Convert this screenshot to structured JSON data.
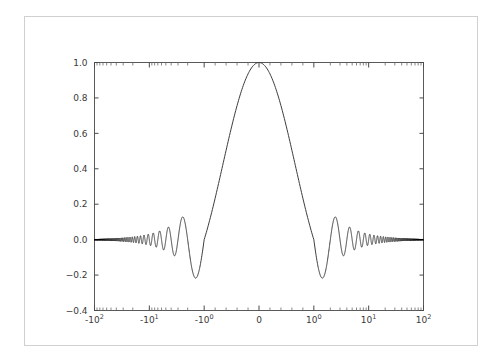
{
  "figure": {
    "background_color": "#ffffff",
    "border_color": "#d0d0d0",
    "line_color": "#3c3c3c",
    "axis_color": "#5a5a5a"
  },
  "chart_data": {
    "type": "line",
    "title": "",
    "xlabel": "",
    "ylabel": "",
    "function": "sinc",
    "xscale": "symlog",
    "yscale": "linear",
    "linthresh": 1,
    "xlim": [
      -100,
      100
    ],
    "ylim": [
      -0.4,
      1.0
    ],
    "grid": false,
    "legend": null,
    "x_tick_labels": [
      "-10^2",
      "-10^1",
      "-10^0",
      "0",
      "10^0",
      "10^1",
      "10^2"
    ],
    "x_tick_values": [
      -100,
      -10,
      -1,
      0,
      1,
      10,
      100
    ],
    "x_tick_mantissas": [
      "-10",
      "-10",
      "-10",
      "0",
      "10",
      "10",
      "10"
    ],
    "x_tick_exponents": [
      "2",
      "1",
      "0",
      "",
      "0",
      "1",
      "2"
    ],
    "y_tick_labels": [
      "1.0",
      "0.8",
      "0.6",
      "0.4",
      "0.2",
      "0.0",
      "−0.2",
      "−0.4"
    ],
    "y_tick_values": [
      1.0,
      0.8,
      0.6,
      0.4,
      0.2,
      0.0,
      -0.2,
      -0.4
    ],
    "series": [
      {
        "name": "sinc(x)",
        "description": "y = sin(pi*x)/(pi*x) sampled densely over x in [-100, 100]",
        "peak_value": 1.0,
        "peak_x": 0,
        "first_trough_value": -0.2172,
        "first_trough_x": [
          -1.4303,
          1.4303
        ],
        "sidelobe_peaks": [
          0.1284,
          -0.0913,
          0.0709,
          -0.058,
          0.049
        ],
        "zero_crossings": [
          -5,
          -4,
          -3,
          -2,
          -1,
          1,
          2,
          3,
          4,
          5
        ]
      }
    ]
  }
}
